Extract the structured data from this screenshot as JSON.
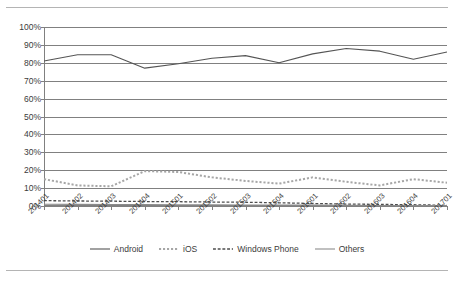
{
  "chart_data": {
    "type": "line",
    "title": "",
    "subtitle": "",
    "xlabel": "",
    "ylabel": "",
    "ylim": [
      0,
      100
    ],
    "ytick_labels": [
      "100%",
      "90%",
      "80%",
      "70%",
      "60%",
      "50%",
      "40%",
      "30%",
      "20%",
      "10%",
      "0%"
    ],
    "ytick_values": [
      100,
      90,
      80,
      70,
      60,
      50,
      40,
      30,
      20,
      10,
      0
    ],
    "grid": "horizontal",
    "legend_position": "bottom-center",
    "categories": [
      "201401",
      "201402",
      "201403",
      "201404",
      "201501",
      "201502",
      "201503",
      "201504",
      "201601",
      "201602",
      "201603",
      "201604",
      "201701"
    ],
    "series": [
      {
        "name": "Android",
        "style": "solid",
        "color": "#555555",
        "values": [
          81,
          84.5,
          84.5,
          77,
          79.5,
          82.5,
          84,
          80,
          85,
          88,
          86.5,
          82,
          86
        ]
      },
      {
        "name": "iOS",
        "style": "dotted",
        "color": "#a6a6a6",
        "values": [
          15,
          11.5,
          11,
          19.5,
          19,
          16,
          14,
          12.5,
          16,
          13.5,
          11.5,
          15,
          13
        ]
      },
      {
        "name": "Windows Phone",
        "style": "dashed",
        "color": "#4d4d4d",
        "values": [
          3,
          2.8,
          2.7,
          2.5,
          2.4,
          2.2,
          2.1,
          1.8,
          1.4,
          1.1,
          0.9,
          0.7,
          0.4
        ]
      },
      {
        "name": "Others",
        "style": "solid",
        "color": "#8c8c8c",
        "values": [
          1,
          0.9,
          0.8,
          0.8,
          0.7,
          0.7,
          0.6,
          0.6,
          0.5,
          0.4,
          0.3,
          0.3,
          0.2
        ]
      }
    ]
  },
  "legend": {
    "items": [
      {
        "label": "Android"
      },
      {
        "label": "iOS"
      },
      {
        "label": "Windows Phone"
      },
      {
        "label": "Others"
      }
    ]
  }
}
